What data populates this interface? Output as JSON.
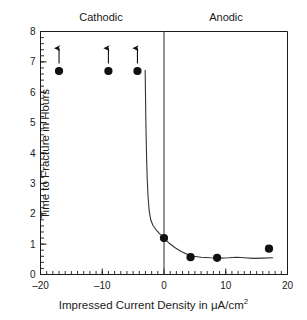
{
  "chart_data": {
    "type": "scatter",
    "title": "",
    "xlabel": "Impressed Current Density in μA/cm",
    "xlabel_superscript": "2",
    "ylabel": "Time to Fracture in Hours",
    "xlim": [
      -20,
      20
    ],
    "ylim": [
      0,
      8
    ],
    "x_major_ticks": [
      -20,
      -10,
      0,
      10,
      20
    ],
    "x_major_tick_labels": [
      "–20",
      "–10",
      "0",
      "10",
      "20"
    ],
    "x_minor_step": 1,
    "y_major_ticks": [
      0,
      1,
      2,
      3,
      4,
      5,
      6,
      7,
      8
    ],
    "y_major_tick_labels": [
      "0",
      "1",
      "2",
      "3",
      "4",
      "5",
      "6",
      "7",
      "8"
    ],
    "y_minor_step": 0.2,
    "grid": false,
    "legend": null,
    "region_labels": [
      {
        "text": "Cathodic",
        "x_center": -10
      },
      {
        "text": "Anodic",
        "x_center": 10
      }
    ],
    "vertical_reference_line": {
      "x": 0,
      "color": "#4d4d4d"
    },
    "series": [
      {
        "name": "Measured data",
        "marker": "filled-circle",
        "color": "#111111",
        "points": [
          {
            "x": -17.0,
            "y": 6.7,
            "arrow_up": true
          },
          {
            "x": -9.0,
            "y": 6.7,
            "arrow_up": true
          },
          {
            "x": -4.3,
            "y": 6.7,
            "arrow_up": true
          },
          {
            "x": 0.0,
            "y": 1.2,
            "arrow_up": false
          },
          {
            "x": 4.3,
            "y": 0.57,
            "arrow_up": false
          },
          {
            "x": 8.6,
            "y": 0.55,
            "arrow_up": false
          },
          {
            "x": 17.0,
            "y": 0.85,
            "arrow_up": false
          }
        ]
      },
      {
        "name": "Fitted curve",
        "marker": "none",
        "color": "#333333",
        "points": [
          {
            "x": -3.05,
            "y": 6.72
          },
          {
            "x": -3.0,
            "y": 6.0
          },
          {
            "x": -2.95,
            "y": 5.2
          },
          {
            "x": -2.88,
            "y": 4.4
          },
          {
            "x": -2.8,
            "y": 3.7
          },
          {
            "x": -2.7,
            "y": 3.05
          },
          {
            "x": -2.58,
            "y": 2.55
          },
          {
            "x": -2.4,
            "y": 2.1
          },
          {
            "x": -2.15,
            "y": 1.8
          },
          {
            "x": -1.8,
            "y": 1.62
          },
          {
            "x": -1.3,
            "y": 1.48
          },
          {
            "x": -0.7,
            "y": 1.34
          },
          {
            "x": 0.0,
            "y": 1.2
          },
          {
            "x": 0.9,
            "y": 1.02
          },
          {
            "x": 1.8,
            "y": 0.88
          },
          {
            "x": 2.8,
            "y": 0.76
          },
          {
            "x": 3.8,
            "y": 0.66
          },
          {
            "x": 4.8,
            "y": 0.6
          },
          {
            "x": 6.0,
            "y": 0.57
          },
          {
            "x": 7.5,
            "y": 0.55
          },
          {
            "x": 9.0,
            "y": 0.54
          },
          {
            "x": 10.5,
            "y": 0.55
          },
          {
            "x": 11.8,
            "y": 0.57
          },
          {
            "x": 13.0,
            "y": 0.55
          },
          {
            "x": 14.5,
            "y": 0.53
          },
          {
            "x": 16.0,
            "y": 0.54
          },
          {
            "x": 17.6,
            "y": 0.55
          }
        ]
      }
    ],
    "annotations": [
      {
        "type": "up-arrow",
        "x": -17.0,
        "y_from": 6.95,
        "y_to": 7.45
      },
      {
        "type": "up-arrow",
        "x": -9.0,
        "y_from": 6.95,
        "y_to": 7.45
      },
      {
        "type": "up-arrow",
        "x": -4.3,
        "y_from": 6.95,
        "y_to": 7.45
      }
    ]
  }
}
